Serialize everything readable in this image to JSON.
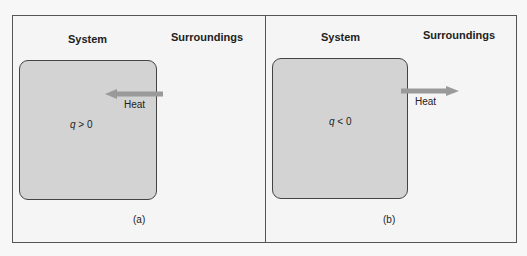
{
  "panels": [
    {
      "id": "a",
      "system_label": "System",
      "surroundings_label": "Surroundings",
      "q_symbol": "q",
      "q_relation": " > 0",
      "heat_label": "Heat",
      "arrow_direction": "left",
      "caption": "(a)"
    },
    {
      "id": "b",
      "system_label": "System",
      "surroundings_label": "Surroundings",
      "q_symbol": "q",
      "q_relation": " < 0",
      "heat_label": "Heat",
      "arrow_direction": "right",
      "caption": "(b)"
    }
  ],
  "colors": {
    "system_fill": "#d3d3d3",
    "arrow": "#9a9a9a",
    "border": "#555555",
    "background": "#f5f5f5"
  }
}
